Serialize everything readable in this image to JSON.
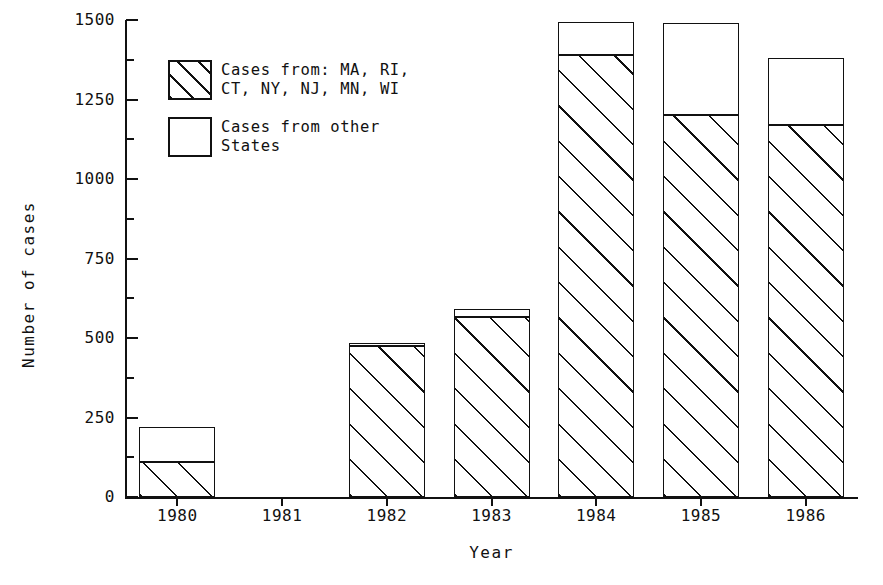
{
  "chart_data": {
    "type": "bar",
    "stacked": true,
    "title": "",
    "xlabel": "Year",
    "ylabel": "Number of cases",
    "categories": [
      "1980",
      "1981",
      "1982",
      "1983",
      "1984",
      "1985",
      "1986"
    ],
    "series": [
      {
        "name": "Cases from: MA, RI, CT, NY, NJ, MN, WI",
        "pattern": "hatched",
        "values": [
          110,
          0,
          475,
          565,
          1390,
          1200,
          1170
        ]
      },
      {
        "name": "Cases from other States",
        "pattern": "open",
        "values": [
          110,
          0,
          10,
          25,
          105,
          290,
          210
        ]
      }
    ],
    "totals": [
      220,
      0,
      485,
      590,
      1495,
      1490,
      1380
    ],
    "ylim": [
      0,
      1500
    ],
    "yticks": [
      0,
      250,
      500,
      750,
      1000,
      1250,
      1500
    ],
    "ytick_labels": [
      "0",
      "250",
      "500",
      "750",
      "1000",
      "1250",
      "1500"
    ],
    "yminor_step": 125,
    "grid": false,
    "legend_position": "upper left"
  },
  "axes": {
    "y_title": "Number of cases",
    "x_title": "Year",
    "y_tick_labels": [
      "1500",
      "1250",
      "1000",
      "750",
      "500",
      "250",
      "0"
    ],
    "x_tick_labels": [
      "1980",
      "1981",
      "1982",
      "1983",
      "1984",
      "1985",
      "1986"
    ]
  },
  "legend": {
    "items": [
      {
        "swatch": "hatched-swatch",
        "line1": "Cases from: MA, RI,",
        "line2": "CT, NY, NJ, MN, WI"
      },
      {
        "swatch": "open-swatch",
        "line1": "Cases from other",
        "line2": "States"
      }
    ]
  },
  "colors": {
    "ink": "#111111",
    "background": "#ffffff"
  }
}
